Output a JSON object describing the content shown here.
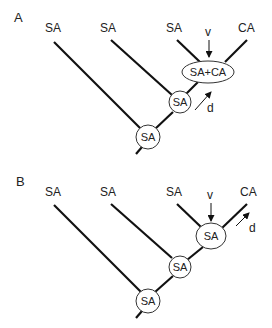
{
  "figure": {
    "panels": [
      {
        "id": "A",
        "label": "A",
        "leaves": [
          "SA",
          "SA",
          "SA",
          "CA"
        ],
        "nodes": [
          {
            "label": "SA+CA",
            "shape": "ellipse"
          },
          {
            "label": "SA",
            "shape": "circle"
          },
          {
            "label": "SA",
            "shape": "circle"
          }
        ],
        "annotations": {
          "v": "v",
          "d": "d"
        }
      },
      {
        "id": "B",
        "label": "B",
        "leaves": [
          "SA",
          "SA",
          "SA",
          "CA"
        ],
        "nodes": [
          {
            "label": "SA",
            "shape": "ellipse"
          },
          {
            "label": "SA",
            "shape": "circle"
          },
          {
            "label": "SA",
            "shape": "circle"
          }
        ],
        "annotations": {
          "v": "v",
          "d": "d"
        }
      }
    ],
    "colors": {
      "line": "#111111",
      "text": "#222222",
      "node_fill": "#ffffff",
      "background": "#ffffff"
    }
  }
}
